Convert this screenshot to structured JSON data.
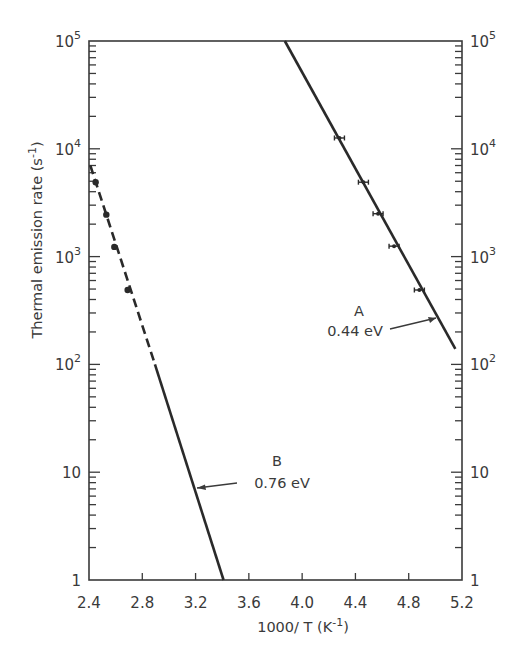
{
  "chart_data": {
    "type": "scatter",
    "title": "",
    "xlabel": "1000/ T (K⁻¹)",
    "ylabel": "Thermal emission rate (s⁻¹)",
    "xlim": [
      2.4,
      5.2
    ],
    "ylim": [
      1,
      100000
    ],
    "yscale": "log",
    "grid": false,
    "legend": null,
    "x_ticks": [
      2.4,
      2.8,
      3.2,
      3.6,
      4.0,
      4.4,
      4.8,
      5.2
    ],
    "x_tick_labels": [
      "2.4",
      "2.8",
      "3.2",
      "3.6",
      "4.0",
      "4.4",
      "4.8",
      "5.2"
    ],
    "y_ticks": [
      1,
      10,
      100,
      1000,
      10000,
      100000
    ],
    "y_tick_labels_left": [
      {
        "base": "1",
        "exp": ""
      },
      {
        "base": "10",
        "exp": ""
      },
      {
        "base": "10",
        "exp": "2"
      },
      {
        "base": "10",
        "exp": "3"
      },
      {
        "base": "10",
        "exp": "4"
      },
      {
        "base": "10",
        "exp": "5"
      }
    ],
    "y_tick_labels_right": [
      {
        "base": "1",
        "exp": ""
      },
      {
        "base": "10",
        "exp": ""
      },
      {
        "base": "10",
        "exp": "2"
      },
      {
        "base": "10",
        "exp": "3"
      },
      {
        "base": "10",
        "exp": "4"
      },
      {
        "base": "10",
        "exp": "5"
      }
    ],
    "series": [
      {
        "name": "A",
        "activation_energy": "0.44 eV",
        "points": [
          {
            "x": 4.28,
            "y": 12600
          },
          {
            "x": 4.46,
            "y": 4900
          },
          {
            "x": 4.57,
            "y": 2500
          },
          {
            "x": 4.69,
            "y": 1250
          },
          {
            "x": 4.88,
            "y": 490
          }
        ],
        "marker": "errorbar-x",
        "fit_line": [
          {
            "x": 3.87,
            "y": 100000
          },
          {
            "x": 5.15,
            "y": 139
          }
        ],
        "fit_style": "solid"
      },
      {
        "name": "B",
        "activation_energy": "0.76 eV",
        "points": [
          {
            "x": 2.45,
            "y": 4900
          },
          {
            "x": 2.53,
            "y": 2450
          },
          {
            "x": 2.59,
            "y": 1230
          },
          {
            "x": 2.69,
            "y": 490
          }
        ],
        "marker": "dot",
        "fit_line_dashed": [
          {
            "x": 2.41,
            "y": 7000
          },
          {
            "x": 2.895,
            "y": 100
          }
        ],
        "fit_line_solid": [
          {
            "x": 2.895,
            "y": 100
          },
          {
            "x": 3.41,
            "y": 1
          }
        ]
      }
    ],
    "annotations": [
      {
        "label": "A",
        "sub": "0.44 eV",
        "arrow_to": {
          "x": 5.02,
          "y": 270
        }
      },
      {
        "label": "B",
        "sub": "0.76 eV",
        "arrow_to": {
          "x": 3.21,
          "y": 7.5
        }
      }
    ]
  },
  "labels": {
    "annot_A": "A",
    "annot_A_energy": "0.44 eV",
    "annot_B": "B",
    "annot_B_energy": "0.76 eV",
    "xlabel": "1000/ T (K",
    "xlabel_sup": "-1",
    "xlabel_close": ")",
    "ylabel": "Thermal emission rate (s",
    "ylabel_sup": "-1",
    "ylabel_close": ")"
  }
}
